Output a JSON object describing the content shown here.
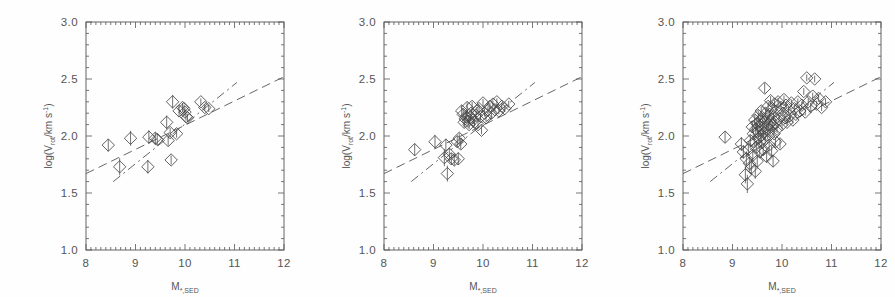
{
  "figure": {
    "background": "#fefefe",
    "ink": "#555555",
    "marker_color": "#444444",
    "panel_count": 3
  },
  "axes": {
    "xlabel_main": "M",
    "xlabel_sub": "*,SED",
    "ylabel_prefix": "log(V",
    "ylabel_sub": "rot",
    "ylabel_mid": "/km s",
    "ylabel_sup": "-1",
    "ylabel_suffix": ")",
    "xlim": [
      8,
      12
    ],
    "ylim": [
      1.0,
      3.0
    ],
    "xticks": [
      8,
      9,
      10,
      11,
      12
    ],
    "xticklabels": [
      "8",
      "9",
      "10",
      "11",
      "12"
    ],
    "yticks": [
      1.0,
      1.5,
      2.0,
      2.5,
      3.0
    ],
    "yticklabels": [
      "1.0",
      "1.5",
      "2.0",
      "2.5",
      "3.0"
    ],
    "xminor_per_major": 10,
    "yminor_per_major": 5,
    "grid": false
  },
  "chart_data": {
    "type": "scatter",
    "title": "",
    "xlabel": "M_{*,SED}",
    "ylabel": "log(V_rot / km s^-1)",
    "xlim": [
      8,
      12
    ],
    "ylim": [
      1.0,
      3.0
    ],
    "marker": "diamond-open",
    "errorbars": "vertical",
    "legend": "none",
    "panels": [
      {
        "name": "panel-left",
        "n_points": 22,
        "points": [
          {
            "x": 8.45,
            "y": 1.92,
            "yerr": 0.055
          },
          {
            "x": 8.68,
            "y": 1.73,
            "yerr": 0.075
          },
          {
            "x": 8.9,
            "y": 1.98,
            "yerr": 0.065
          },
          {
            "x": 9.25,
            "y": 1.73,
            "yerr": 0.06
          },
          {
            "x": 9.27,
            "y": 1.99,
            "yerr": 0.06
          },
          {
            "x": 9.4,
            "y": 1.98,
            "yerr": 0.055
          },
          {
            "x": 9.44,
            "y": 1.97,
            "yerr": 0.05
          },
          {
            "x": 9.63,
            "y": 2.12,
            "yerr": 0.06
          },
          {
            "x": 9.66,
            "y": 1.96,
            "yerr": 0.045
          },
          {
            "x": 9.7,
            "y": 2.03,
            "yerr": 0.04
          },
          {
            "x": 9.72,
            "y": 1.79,
            "yerr": 0.04
          },
          {
            "x": 9.75,
            "y": 2.3,
            "yerr": 0.06
          },
          {
            "x": 9.83,
            "y": 2.02,
            "yerr": 0.035
          },
          {
            "x": 9.88,
            "y": 2.22,
            "yerr": 0.045
          },
          {
            "x": 9.95,
            "y": 2.25,
            "yerr": 0.04
          },
          {
            "x": 9.98,
            "y": 2.24,
            "yerr": 0.035
          },
          {
            "x": 10.0,
            "y": 2.21,
            "yerr": 0.04
          },
          {
            "x": 10.02,
            "y": 2.17,
            "yerr": 0.035
          },
          {
            "x": 10.05,
            "y": 2.16,
            "yerr": 0.035
          },
          {
            "x": 10.32,
            "y": 2.3,
            "yerr": 0.03
          },
          {
            "x": 10.4,
            "y": 2.25,
            "yerr": 0.03
          },
          {
            "x": 10.48,
            "y": 2.24,
            "yerr": 0.03
          }
        ],
        "lines": [
          {
            "name": "dashed-fit",
            "style": "dashed",
            "x1": 8.0,
            "y1": 1.67,
            "x2": 12.0,
            "y2": 2.52
          },
          {
            "name": "dash-dot-fit",
            "style": "dash-dot",
            "x1": 8.55,
            "y1": 1.6,
            "x2": 11.05,
            "y2": 2.47
          }
        ]
      },
      {
        "name": "panel-middle",
        "n_points": 44,
        "points": [
          {
            "x": 8.62,
            "y": 1.88,
            "yerr": 0.055
          },
          {
            "x": 9.03,
            "y": 1.95,
            "yerr": 0.06
          },
          {
            "x": 9.22,
            "y": 1.81,
            "yerr": 0.075
          },
          {
            "x": 9.25,
            "y": 1.92,
            "yerr": 0.055
          },
          {
            "x": 9.28,
            "y": 1.67,
            "yerr": 0.07
          },
          {
            "x": 9.32,
            "y": 1.84,
            "yerr": 0.055
          },
          {
            "x": 9.36,
            "y": 1.8,
            "yerr": 0.05
          },
          {
            "x": 9.42,
            "y": 1.79,
            "yerr": 0.05
          },
          {
            "x": 9.48,
            "y": 1.95,
            "yerr": 0.05
          },
          {
            "x": 9.5,
            "y": 1.8,
            "yerr": 0.055
          },
          {
            "x": 9.52,
            "y": 1.98,
            "yerr": 0.045
          },
          {
            "x": 9.55,
            "y": 1.93,
            "yerr": 0.045
          },
          {
            "x": 9.57,
            "y": 2.22,
            "yerr": 0.05
          },
          {
            "x": 9.6,
            "y": 2.19,
            "yerr": 0.045
          },
          {
            "x": 9.62,
            "y": 2.12,
            "yerr": 0.045
          },
          {
            "x": 9.64,
            "y": 2.15,
            "yerr": 0.04
          },
          {
            "x": 9.66,
            "y": 2.17,
            "yerr": 0.04
          },
          {
            "x": 9.68,
            "y": 2.25,
            "yerr": 0.045
          },
          {
            "x": 9.7,
            "y": 2.13,
            "yerr": 0.04
          },
          {
            "x": 9.72,
            "y": 2.1,
            "yerr": 0.04
          },
          {
            "x": 9.74,
            "y": 2.16,
            "yerr": 0.035
          },
          {
            "x": 9.76,
            "y": 2.2,
            "yerr": 0.035
          },
          {
            "x": 9.78,
            "y": 2.26,
            "yerr": 0.04
          },
          {
            "x": 9.8,
            "y": 2.14,
            "yerr": 0.035
          },
          {
            "x": 9.83,
            "y": 2.12,
            "yerr": 0.035
          },
          {
            "x": 9.86,
            "y": 2.18,
            "yerr": 0.035
          },
          {
            "x": 9.88,
            "y": 2.22,
            "yerr": 0.035
          },
          {
            "x": 9.9,
            "y": 2.1,
            "yerr": 0.035
          },
          {
            "x": 9.92,
            "y": 2.24,
            "yerr": 0.035
          },
          {
            "x": 9.95,
            "y": 2.17,
            "yerr": 0.03
          },
          {
            "x": 9.97,
            "y": 2.05,
            "yerr": 0.035
          },
          {
            "x": 10.0,
            "y": 2.29,
            "yerr": 0.035
          },
          {
            "x": 10.03,
            "y": 2.2,
            "yerr": 0.03
          },
          {
            "x": 10.06,
            "y": 2.16,
            "yerr": 0.03
          },
          {
            "x": 10.1,
            "y": 2.23,
            "yerr": 0.03
          },
          {
            "x": 10.14,
            "y": 2.26,
            "yerr": 0.03
          },
          {
            "x": 10.17,
            "y": 2.2,
            "yerr": 0.03
          },
          {
            "x": 10.2,
            "y": 2.28,
            "yerr": 0.03
          },
          {
            "x": 10.24,
            "y": 2.23,
            "yerr": 0.03
          },
          {
            "x": 10.28,
            "y": 2.3,
            "yerr": 0.03
          },
          {
            "x": 10.32,
            "y": 2.22,
            "yerr": 0.03
          },
          {
            "x": 10.38,
            "y": 2.26,
            "yerr": 0.03
          },
          {
            "x": 10.44,
            "y": 2.24,
            "yerr": 0.03
          },
          {
            "x": 10.52,
            "y": 2.28,
            "yerr": 0.03
          }
        ],
        "lines": [
          {
            "name": "dashed-fit",
            "style": "dashed",
            "x1": 8.0,
            "y1": 1.67,
            "x2": 12.0,
            "y2": 2.52
          },
          {
            "name": "dash-dot-fit",
            "style": "dash-dot",
            "x1": 8.55,
            "y1": 1.6,
            "x2": 11.05,
            "y2": 2.47
          }
        ]
      },
      {
        "name": "panel-right",
        "n_points": 88,
        "points": [
          {
            "x": 8.85,
            "y": 1.99,
            "yerr": 0.05
          },
          {
            "x": 9.18,
            "y": 1.93,
            "yerr": 0.06
          },
          {
            "x": 9.22,
            "y": 1.86,
            "yerr": 0.06
          },
          {
            "x": 9.26,
            "y": 1.66,
            "yerr": 0.075
          },
          {
            "x": 9.28,
            "y": 1.8,
            "yerr": 0.065
          },
          {
            "x": 9.3,
            "y": 1.58,
            "yerr": 0.08
          },
          {
            "x": 9.32,
            "y": 1.88,
            "yerr": 0.055
          },
          {
            "x": 9.34,
            "y": 1.76,
            "yerr": 0.06
          },
          {
            "x": 9.36,
            "y": 1.96,
            "yerr": 0.05
          },
          {
            "x": 9.38,
            "y": 1.72,
            "yerr": 0.06
          },
          {
            "x": 9.4,
            "y": 2.08,
            "yerr": 0.05
          },
          {
            "x": 9.41,
            "y": 1.83,
            "yerr": 0.055
          },
          {
            "x": 9.42,
            "y": 2.02,
            "yerr": 0.045
          },
          {
            "x": 9.44,
            "y": 1.95,
            "yerr": 0.05
          },
          {
            "x": 9.45,
            "y": 2.14,
            "yerr": 0.045
          },
          {
            "x": 9.46,
            "y": 1.69,
            "yerr": 0.065
          },
          {
            "x": 9.47,
            "y": 2.06,
            "yerr": 0.045
          },
          {
            "x": 9.48,
            "y": 1.9,
            "yerr": 0.05
          },
          {
            "x": 9.49,
            "y": 2.11,
            "yerr": 0.045
          },
          {
            "x": 9.5,
            "y": 1.78,
            "yerr": 0.055
          },
          {
            "x": 9.51,
            "y": 2.04,
            "yerr": 0.045
          },
          {
            "x": 9.52,
            "y": 2.18,
            "yerr": 0.045
          },
          {
            "x": 9.53,
            "y": 1.98,
            "yerr": 0.045
          },
          {
            "x": 9.54,
            "y": 2.09,
            "yerr": 0.04
          },
          {
            "x": 9.55,
            "y": 1.86,
            "yerr": 0.05
          },
          {
            "x": 9.56,
            "y": 2.13,
            "yerr": 0.04
          },
          {
            "x": 9.57,
            "y": 2.0,
            "yerr": 0.045
          },
          {
            "x": 9.58,
            "y": 2.22,
            "yerr": 0.04
          },
          {
            "x": 9.59,
            "y": 1.94,
            "yerr": 0.045
          },
          {
            "x": 9.6,
            "y": 2.07,
            "yerr": 0.04
          },
          {
            "x": 9.61,
            "y": 2.16,
            "yerr": 0.04
          },
          {
            "x": 9.62,
            "y": 1.88,
            "yerr": 0.05
          },
          {
            "x": 9.63,
            "y": 2.03,
            "yerr": 0.04
          },
          {
            "x": 9.64,
            "y": 2.12,
            "yerr": 0.04
          },
          {
            "x": 9.65,
            "y": 2.42,
            "yerr": 0.045
          },
          {
            "x": 9.66,
            "y": 1.97,
            "yerr": 0.04
          },
          {
            "x": 9.67,
            "y": 2.2,
            "yerr": 0.04
          },
          {
            "x": 9.68,
            "y": 2.08,
            "yerr": 0.04
          },
          {
            "x": 9.69,
            "y": 1.82,
            "yerr": 0.05
          },
          {
            "x": 9.7,
            "y": 2.15,
            "yerr": 0.04
          },
          {
            "x": 9.71,
            "y": 2.01,
            "yerr": 0.04
          },
          {
            "x": 9.72,
            "y": 2.26,
            "yerr": 0.04
          },
          {
            "x": 9.73,
            "y": 2.1,
            "yerr": 0.035
          },
          {
            "x": 9.74,
            "y": 1.92,
            "yerr": 0.045
          },
          {
            "x": 9.75,
            "y": 2.19,
            "yerr": 0.035
          },
          {
            "x": 9.76,
            "y": 2.05,
            "yerr": 0.04
          },
          {
            "x": 9.77,
            "y": 2.31,
            "yerr": 0.04
          },
          {
            "x": 9.78,
            "y": 2.13,
            "yerr": 0.035
          },
          {
            "x": 9.79,
            "y": 1.87,
            "yerr": 0.045
          },
          {
            "x": 9.8,
            "y": 2.24,
            "yerr": 0.035
          },
          {
            "x": 9.81,
            "y": 2.09,
            "yerr": 0.035
          },
          {
            "x": 9.82,
            "y": 1.78,
            "yerr": 0.05
          },
          {
            "x": 9.83,
            "y": 2.17,
            "yerr": 0.035
          },
          {
            "x": 9.84,
            "y": 2.02,
            "yerr": 0.04
          },
          {
            "x": 9.85,
            "y": 2.28,
            "yerr": 0.035
          },
          {
            "x": 9.86,
            "y": 2.12,
            "yerr": 0.035
          },
          {
            "x": 9.87,
            "y": 1.95,
            "yerr": 0.04
          },
          {
            "x": 9.88,
            "y": 2.22,
            "yerr": 0.035
          },
          {
            "x": 9.9,
            "y": 2.06,
            "yerr": 0.035
          },
          {
            "x": 9.92,
            "y": 2.3,
            "yerr": 0.035
          },
          {
            "x": 9.94,
            "y": 2.15,
            "yerr": 0.035
          },
          {
            "x": 9.96,
            "y": 1.93,
            "yerr": 0.04
          },
          {
            "x": 9.98,
            "y": 2.25,
            "yerr": 0.035
          },
          {
            "x": 10.0,
            "y": 2.1,
            "yerr": 0.035
          },
          {
            "x": 10.02,
            "y": 2.2,
            "yerr": 0.03
          },
          {
            "x": 10.04,
            "y": 2.32,
            "yerr": 0.035
          },
          {
            "x": 10.06,
            "y": 2.16,
            "yerr": 0.03
          },
          {
            "x": 10.08,
            "y": 2.27,
            "yerr": 0.03
          },
          {
            "x": 10.1,
            "y": 2.12,
            "yerr": 0.03
          },
          {
            "x": 10.13,
            "y": 2.23,
            "yerr": 0.03
          },
          {
            "x": 10.16,
            "y": 2.18,
            "yerr": 0.03
          },
          {
            "x": 10.19,
            "y": 2.29,
            "yerr": 0.03
          },
          {
            "x": 10.22,
            "y": 2.14,
            "yerr": 0.03
          },
          {
            "x": 10.25,
            "y": 2.24,
            "yerr": 0.03
          },
          {
            "x": 10.28,
            "y": 2.19,
            "yerr": 0.03
          },
          {
            "x": 10.32,
            "y": 2.3,
            "yerr": 0.03
          },
          {
            "x": 10.36,
            "y": 2.22,
            "yerr": 0.03
          },
          {
            "x": 10.4,
            "y": 2.27,
            "yerr": 0.03
          },
          {
            "x": 10.44,
            "y": 2.39,
            "yerr": 0.03
          },
          {
            "x": 10.47,
            "y": 2.21,
            "yerr": 0.03
          },
          {
            "x": 10.5,
            "y": 2.51,
            "yerr": 0.03
          },
          {
            "x": 10.53,
            "y": 2.3,
            "yerr": 0.03
          },
          {
            "x": 10.58,
            "y": 2.26,
            "yerr": 0.03
          },
          {
            "x": 10.62,
            "y": 2.35,
            "yerr": 0.03
          },
          {
            "x": 10.66,
            "y": 2.5,
            "yerr": 0.03
          },
          {
            "x": 10.7,
            "y": 2.28,
            "yerr": 0.03
          },
          {
            "x": 10.74,
            "y": 2.33,
            "yerr": 0.03
          },
          {
            "x": 10.8,
            "y": 2.25,
            "yerr": 0.03
          },
          {
            "x": 10.88,
            "y": 2.3,
            "yerr": 0.03
          }
        ],
        "lines": [
          {
            "name": "dashed-fit",
            "style": "dashed",
            "x1": 8.0,
            "y1": 1.67,
            "x2": 12.0,
            "y2": 2.52
          },
          {
            "name": "dash-dot-fit",
            "style": "dash-dot",
            "x1": 8.55,
            "y1": 1.6,
            "x2": 11.05,
            "y2": 2.47
          }
        ]
      }
    ]
  }
}
